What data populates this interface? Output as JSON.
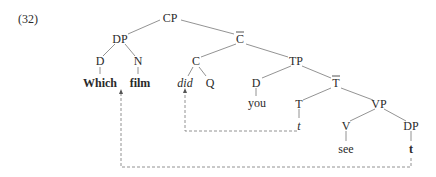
{
  "example_number": "(32)",
  "nodes": {
    "cp": "CP",
    "dp": "DP",
    "d_which": "D",
    "n_film": "N",
    "which": "Which",
    "film": "film",
    "cbar": "C",
    "c": "C",
    "did": "did",
    "q": "Q",
    "tp": "TP",
    "d_you": "D",
    "you": "you",
    "tbar": "T",
    "t_head": "T",
    "t_trace": "t",
    "vp": "VP",
    "v": "V",
    "see": "see",
    "dp_obj": "DP",
    "dp_trace": "t"
  },
  "colors": {
    "edge": "#777777",
    "text": "#2a2a2a"
  }
}
